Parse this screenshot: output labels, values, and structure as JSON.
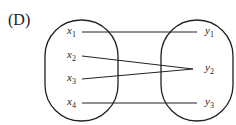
{
  "option_label": "(D)",
  "domain_set": [
    {
      "name": "x",
      "sub": "1"
    },
    {
      "name": "x",
      "sub": "2"
    },
    {
      "name": "x",
      "sub": "3"
    },
    {
      "name": "x",
      "sub": "4"
    }
  ],
  "codomain_set": [
    {
      "name": "y",
      "sub": "1"
    },
    {
      "name": "y",
      "sub": "2"
    },
    {
      "name": "y",
      "sub": "3"
    }
  ],
  "mappings": [
    {
      "from": "x1",
      "to": "y1"
    },
    {
      "from": "x2",
      "to": "y2"
    },
    {
      "from": "x3",
      "to": "y2"
    },
    {
      "from": "x4",
      "to": "y3"
    }
  ]
}
